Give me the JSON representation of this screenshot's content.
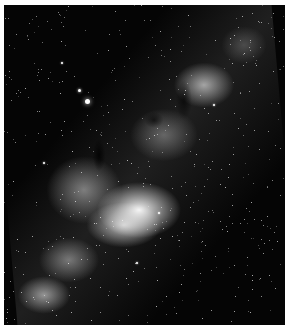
{
  "image": {
    "subject": "Milky Way galactic band photograph",
    "style": "grayscale",
    "palette": {
      "background": "#050505",
      "core": "#ffffff",
      "border": "#ffffff"
    },
    "bright_stars": [
      {
        "x": 83,
        "y": 96,
        "r": 2.5
      },
      {
        "x": 75,
        "y": 85,
        "r": 1.5
      },
      {
        "x": 58,
        "y": 58,
        "r": 1
      },
      {
        "x": 40,
        "y": 158,
        "r": 1
      },
      {
        "x": 133,
        "y": 258,
        "r": 1
      },
      {
        "x": 155,
        "y": 208,
        "r": 1
      },
      {
        "x": 210,
        "y": 100,
        "r": 1
      }
    ]
  }
}
